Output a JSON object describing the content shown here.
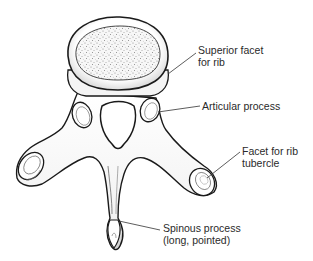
{
  "figure": {
    "colors": {
      "outline": "#1a1a1a",
      "fill": "#ffffff",
      "shade": "#d8d8d8",
      "speckle": "#8a8a8a",
      "leader": "#333333",
      "text": "#2a2a2a"
    }
  },
  "labels": [
    {
      "id": "superior-facet",
      "lines": [
        "Superior facet",
        "for rib"
      ]
    },
    {
      "id": "articular-process",
      "lines": [
        "Articular process"
      ]
    },
    {
      "id": "rib-tubercle-facet",
      "lines": [
        "Facet for rib",
        "tubercle"
      ]
    },
    {
      "id": "spinous-process",
      "lines": [
        "Spinous process",
        "(long, pointed)"
      ]
    }
  ]
}
